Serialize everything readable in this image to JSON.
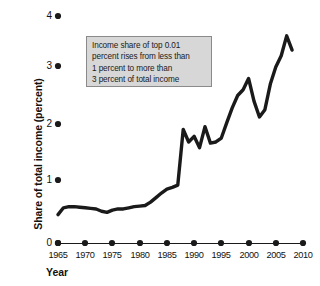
{
  "chart_data": {
    "type": "line",
    "title": "",
    "xlabel": "Year",
    "ylabel": "Share of total income (percent)",
    "xlim": [
      1964,
      2011
    ],
    "ylim": [
      0,
      4
    ],
    "grid": false,
    "legend": "none",
    "xticks": [
      "1965",
      "1970",
      "1975",
      "1980",
      "1985",
      "1990",
      "1995",
      "2000",
      "2005",
      "2010"
    ],
    "xtick_values": [
      1965,
      1970,
      1975,
      1980,
      1985,
      1990,
      1995,
      2000,
      2005,
      2010
    ],
    "yticks": [
      "0",
      "1",
      "2",
      "3",
      "4"
    ],
    "ytick_values": [
      0,
      1,
      2,
      3,
      4
    ],
    "series": [
      {
        "name": "Income share of top 0.01 percent",
        "color": "#1a1a1a",
        "x": [
          1965,
          1966,
          1967,
          1968,
          1969,
          1970,
          1971,
          1972,
          1973,
          1974,
          1975,
          1976,
          1977,
          1978,
          1979,
          1980,
          1981,
          1982,
          1983,
          1984,
          1985,
          1986,
          1987,
          1988,
          1989,
          1990,
          1991,
          1992,
          1993,
          1994,
          1995,
          1996,
          1997,
          1998,
          1999,
          2000,
          2001,
          2002,
          2003,
          2004,
          2005,
          2006,
          2007,
          2008
        ],
        "values": [
          0.5,
          0.62,
          0.64,
          0.64,
          0.63,
          0.62,
          0.61,
          0.6,
          0.56,
          0.54,
          0.58,
          0.6,
          0.6,
          0.62,
          0.64,
          0.65,
          0.66,
          0.72,
          0.8,
          0.88,
          0.95,
          0.98,
          1.02,
          2.0,
          1.78,
          1.88,
          1.68,
          2.05,
          1.76,
          1.78,
          1.85,
          2.12,
          2.38,
          2.6,
          2.7,
          2.9,
          2.5,
          2.22,
          2.35,
          2.8,
          3.1,
          3.3,
          3.65,
          3.4
        ]
      }
    ],
    "annotations": [
      {
        "name": "callout-box",
        "lines": [
          "Income share of top 0.01",
          "percent rises from less than",
          "1 percent to more than",
          "3 percent of total income"
        ],
        "fill": "#d7d7d7",
        "border": "#8a8a8a"
      }
    ]
  }
}
